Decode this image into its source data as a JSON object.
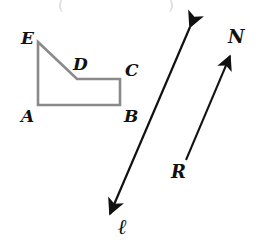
{
  "figure": {
    "canvas": {
      "width": 260,
      "height": 244,
      "background": "#ffffff"
    },
    "colors": {
      "polygon_stroke": "#8a8a8a",
      "line_stroke": "#111111",
      "label_color": "#111111",
      "artifact_gray": "#d8d8d8"
    },
    "polygon": {
      "name": "ABCDE",
      "stroke_width": 2.6,
      "points": "38,42 77,79 120,79 120,105 38,105",
      "vertices": [
        {
          "id": "E",
          "label": "E",
          "x": 38,
          "y": 42,
          "label_x": 21,
          "label_y": 30
        },
        {
          "id": "D",
          "label": "D",
          "x": 77,
          "y": 79,
          "label_x": 73,
          "label_y": 56
        },
        {
          "id": "C",
          "label": "C",
          "x": 120,
          "y": 79,
          "label_x": 125,
          "label_y": 62
        },
        {
          "id": "B",
          "label": "B",
          "x": 120,
          "y": 105,
          "label_x": 124,
          "label_y": 108
        },
        {
          "id": "A",
          "label": "A",
          "x": 38,
          "y": 105,
          "label_x": 21,
          "label_y": 108
        }
      ]
    },
    "line_l": {
      "label": "ℓ",
      "type": "double-headed-line",
      "stroke_width": 2.2,
      "x1": 190,
      "y1": 27,
      "x2": 110,
      "y2": 214,
      "label_x": 118,
      "label_y": 216
    },
    "ray_rn": {
      "label_start": "R",
      "label_end": "N",
      "type": "single-headed-ray",
      "stroke_width": 2.0,
      "x1": 186,
      "y1": 160,
      "x2": 230,
      "y2": 56,
      "label_start_x": 171,
      "label_start_y": 163,
      "label_end_x": 228,
      "label_end_y": 28
    },
    "top_artifacts": [
      {
        "text": "(",
        "x": 58,
        "y": -2
      },
      {
        "text": ")",
        "x": 168,
        "y": -2
      }
    ]
  }
}
